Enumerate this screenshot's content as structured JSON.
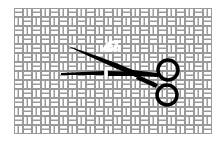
{
  "image": {
    "description": "Basket-weave fabric pattern with black scissors cutting a white thread",
    "alt_text": "Scissors cutting thread on woven fabric"
  },
  "colors": {
    "background": "#ffffff",
    "weave_line": "#9a9a9a",
    "weave_fill": "#ffffff",
    "scissors": "#000000",
    "thread": "#ffffff"
  },
  "icons": [
    "weave-pattern",
    "scissors-icon",
    "thread-icon"
  ]
}
